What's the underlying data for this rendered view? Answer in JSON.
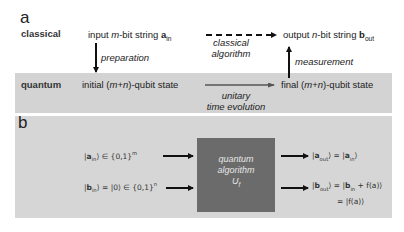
{
  "panel_a": {
    "letter": "a",
    "row_labels": {
      "classical": "classical",
      "quantum": "quantum"
    },
    "input": {
      "prefix": "input ",
      "var": "m",
      "suffix": "-bit string ",
      "bold": "a",
      "sub": "in"
    },
    "output": {
      "prefix": "output ",
      "var": "n",
      "suffix": "-bit string ",
      "bold": "b",
      "sub": "out"
    },
    "initial": {
      "prefix": "initial (",
      "var1": "m",
      "plus": "+",
      "var2": "n",
      "suffix": ")-qubit state"
    },
    "final": {
      "prefix": "final (",
      "var1": "m",
      "plus": "+",
      "var2": "n",
      "suffix": ")-qubit state"
    },
    "arrows": {
      "preparation": "preparation",
      "classical_algorithm_line1": "classical",
      "classical_algorithm_line2": "algorithm",
      "measurement": "measurement",
      "unitary_line1": "unitary",
      "unitary_line2": "time evolution"
    }
  },
  "panel_b": {
    "letter": "b",
    "input_a": {
      "ket": "a",
      "sub": "in",
      "set": "∈ {0,1}",
      "sup": "m"
    },
    "input_b": {
      "ket": "b",
      "sub": "in",
      "eq": "= |0⟩ ∈ {0,1}",
      "sup": "n"
    },
    "box": {
      "line1": "quantum",
      "line2": "algorithm",
      "line3": "U",
      "line3_sub": "f"
    },
    "output_a": {
      "ket": "a",
      "sub": "out",
      "rhs_ket": "a",
      "rhs_sub": "in"
    },
    "output_b": {
      "ket": "b",
      "sub": "out",
      "rhs_ket": "b",
      "rhs_sub": "in",
      "rhs_tail": " + f(a)",
      "line2": "= |f(a)⟩"
    }
  },
  "colors": {
    "band": "#d3d3d3",
    "panel_b_bg": "#d6d6d6",
    "quantum_box": "#6b6b6b",
    "arrow": "#111111",
    "grey_arrow": "#555555"
  }
}
